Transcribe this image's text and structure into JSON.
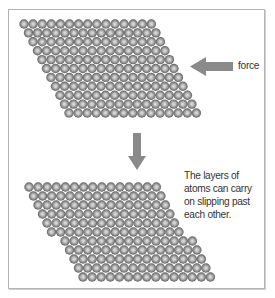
{
  "diagram": {
    "force_label": "force",
    "caption_lines": [
      "The layers of",
      "atoms can carry",
      "on slipping past",
      "each other."
    ],
    "colors": {
      "atom_rim": "#6e6e6e",
      "atom_center": "#dcdcdc",
      "arrow": "#8a8a8a",
      "frame": "#b4b4b4",
      "text": "#333333"
    },
    "top_lattice": {
      "rows": 11,
      "atoms_per_row": 15,
      "origin_x": 24,
      "origin_y": 24,
      "pitch_x": 9.1,
      "pitch_y": 8.9,
      "row_shift": 4.5,
      "atom_radius": 4.7
    },
    "bottom_lattice": {
      "rows": 11,
      "atoms_per_row": 15,
      "origin_x": 29,
      "origin_y": 187,
      "pitch_x": 9.1,
      "pitch_y": 9.0,
      "row_shift": 4.5,
      "atom_radius": 4.7,
      "slip_after_row": 6,
      "slip_offset": 9
    }
  }
}
